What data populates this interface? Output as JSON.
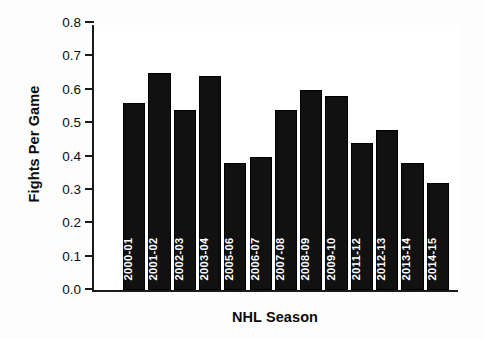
{
  "chart_data": {
    "type": "bar",
    "title": "",
    "xlabel": "NHL Season",
    "ylabel": "Fights Per Game",
    "categories": [
      "2000-01",
      "2001-02",
      "2002-03",
      "2003-04",
      "2005-06",
      "2006-07",
      "2007-08",
      "2008-09",
      "2009-10",
      "2011-12",
      "2012-13",
      "2013-14",
      "2014-15"
    ],
    "values": [
      0.56,
      0.65,
      0.54,
      0.64,
      0.38,
      0.4,
      0.54,
      0.6,
      0.58,
      0.44,
      0.48,
      0.38,
      0.32
    ],
    "ylim": [
      0.0,
      0.8
    ],
    "ytick_labels": [
      "0.0",
      "0.1",
      "0.2",
      "0.3",
      "0.4",
      "0.5",
      "0.6",
      "0.7",
      "0.8"
    ],
    "ytick_values": [
      0.0,
      0.1,
      0.2,
      0.3,
      0.4,
      0.5,
      0.6,
      0.7,
      0.8
    ],
    "grid": false,
    "legend": null,
    "bar_color": "#111111",
    "bar_label_color": "#ffffff",
    "axis_color": "#1a1a1a",
    "background_color": "#ffffff"
  }
}
